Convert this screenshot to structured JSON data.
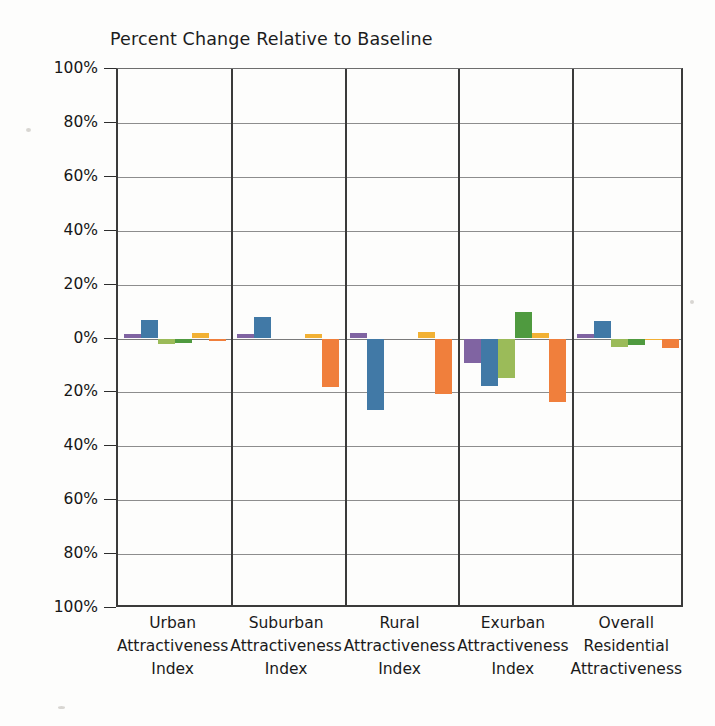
{
  "chart_data": {
    "type": "bar",
    "title": "Percent Change Relative to Baseline",
    "xlabel": "",
    "ylabel": "",
    "ylim": [
      -100,
      100
    ],
    "grid": true,
    "legend_position": "none",
    "y_tick_labels": [
      "100%",
      "80%",
      "60%",
      "40%",
      "20%",
      "0%",
      "20%",
      "40%",
      "60%",
      "80%",
      "100%"
    ],
    "y_tick_values": [
      100,
      80,
      60,
      40,
      20,
      0,
      -20,
      -40,
      -60,
      -80,
      -100
    ],
    "categories": [
      "Urban Attractiveness Index",
      "Suburban Attractiveness Index",
      "Rural Attractiveness Index",
      "Exurban Attractiveness Index",
      "Overall Residential Attractiveness"
    ],
    "category_label_lines": [
      [
        "Urban",
        "Attractiveness",
        "Index"
      ],
      [
        "Suburban",
        "Attractiveness",
        "Index"
      ],
      [
        "Rural",
        "Attractiveness",
        "Index"
      ],
      [
        "Exurban",
        "Attractiveness",
        "Index"
      ],
      [
        "Overall",
        "Residential",
        "Attractiveness"
      ]
    ],
    "series": [
      {
        "name": "Series 1",
        "color": "#8064A2",
        "values": [
          1.5,
          1.5,
          2.0,
          -9.0,
          1.5
        ]
      },
      {
        "name": "Series 2",
        "color": "#4179A6",
        "values": [
          7.0,
          8.0,
          -26.5,
          -17.5,
          6.5
        ]
      },
      {
        "name": "Series 3",
        "color": "#9BBB59",
        "values": [
          -2.0,
          0.0,
          0.0,
          -14.5,
          -3.0
        ]
      },
      {
        "name": "Series 4",
        "color": "#4F9A3F",
        "values": [
          -1.5,
          0.0,
          0.0,
          10.0,
          -2.5
        ]
      },
      {
        "name": "Series 5",
        "color": "#F2B134",
        "values": [
          2.0,
          1.5,
          2.5,
          2.0,
          -0.5
        ]
      },
      {
        "name": "Series 6",
        "color": "#F07F3C",
        "values": [
          -1.0,
          -18.0,
          -20.5,
          -23.5,
          -3.5
        ]
      }
    ]
  }
}
